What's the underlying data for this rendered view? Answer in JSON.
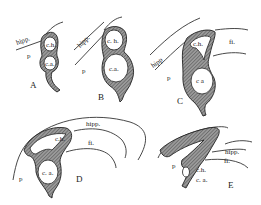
{
  "figure": {
    "panels": [
      {
        "id": "A",
        "labels": {
          "hipp": "hipp.",
          "p": "p",
          "ch": "c.h.",
          "ca": "c.a."
        }
      },
      {
        "id": "B",
        "labels": {
          "hipp": "hipp.",
          "p": "p",
          "ch": "c. h.",
          "ca": "c.a."
        }
      },
      {
        "id": "C",
        "labels": {
          "hipp": "hipp",
          "p": "p",
          "ch": "c.h.",
          "ca": "c a",
          "fi": "fi."
        }
      },
      {
        "id": "D",
        "labels": {
          "hipp": "hipp.",
          "p": "p",
          "ch": "c.h.",
          "ca": "c. a.",
          "fi": "fi."
        }
      },
      {
        "id": "E",
        "labels": {
          "hipp": "hipp.",
          "p": "p",
          "ch": "c.h.",
          "ca": "c. a.",
          "fi": "fi."
        }
      }
    ]
  }
}
